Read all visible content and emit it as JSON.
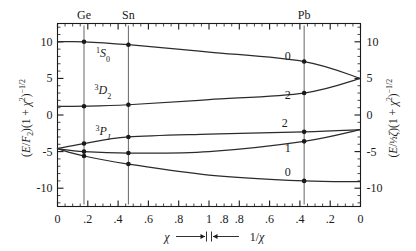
{
  "figure": {
    "left_axis_label": "(E/F₂)(1+χ²)⁻¹ᐟ²",
    "right_axis_label": "(E/½ζ)(1+χ²)⁻¹ᐟ²",
    "x_axis_caption_left": "χ",
    "x_axis_caption_right": "1/χ",
    "element_markers": [
      "Ge",
      "Sn",
      "Pb"
    ],
    "term_symbols": [
      "¹S₀",
      "³D₂",
      "³P_J"
    ],
    "curve_labels_right": [
      "0",
      "2",
      "2",
      "1",
      "0"
    ]
  },
  "chart_data": {
    "type": "line",
    "title": "",
    "xlabel": "χ  →|←  1/χ",
    "ylabel": "(E/F₂)(1+χ²)^-1/2",
    "ylabel_right": "(E/½ζ)(1+χ²)^-1/2",
    "ylim": [
      -12.5,
      12.5
    ],
    "yticks": [
      -10,
      -5,
      0,
      5,
      10
    ],
    "ytick_labels_left": [
      "-10",
      "-5",
      "0",
      "5",
      "10"
    ],
    "ytick_labels_right": [
      "-10",
      "-5",
      "0",
      "5",
      "10"
    ],
    "grid": false,
    "x_axis_split": {
      "left_half_var": "χ",
      "left_half_ticks": [
        0,
        0.2,
        0.4,
        0.6,
        0.8,
        1.0
      ],
      "left_half_tick_labels": [
        "0",
        ".2",
        ".4",
        ".6",
        ".8",
        "1"
      ],
      "right_half_var": "1/χ",
      "right_half_ticks": [
        1.0,
        0.8,
        0.6,
        0.4,
        0.2,
        0
      ],
      "right_half_tick_labels": [
        "1",
        ".8",
        ".6",
        ".4",
        ".2",
        "0"
      ]
    },
    "element_vlines": [
      {
        "label": "Ge",
        "u": 0.175
      },
      {
        "label": "Sn",
        "u": 0.468
      },
      {
        "label": "Pb",
        "u": 1.628
      }
    ],
    "series": [
      {
        "name": "1S0",
        "term": "¹S₀",
        "right_label": "0",
        "u": [
          0.0,
          0.175,
          0.468,
          1.0,
          1.628,
          2.0
        ],
        "values": [
          10.0,
          10.0,
          9.6,
          8.6,
          7.3,
          5.0
        ]
      },
      {
        "name": "3D2",
        "term": "³D₂",
        "right_label": "2",
        "u": [
          0.0,
          0.175,
          0.468,
          1.0,
          1.628,
          2.0
        ],
        "values": [
          1.2,
          1.2,
          1.4,
          2.1,
          3.0,
          5.0
        ]
      },
      {
        "name": "3P2",
        "term": "³P₂",
        "right_label": "2",
        "u": [
          0.0,
          0.175,
          0.468,
          1.0,
          1.628,
          2.0
        ],
        "values": [
          -4.6,
          -3.9,
          -3.0,
          -2.6,
          -2.3,
          -2.0
        ]
      },
      {
        "name": "3P1",
        "term": "³P₁",
        "right_label": "1",
        "u": [
          0.0,
          0.175,
          0.468,
          1.0,
          1.628,
          2.0
        ],
        "values": [
          -4.6,
          -5.0,
          -5.2,
          -5.0,
          -3.6,
          -2.0
        ]
      },
      {
        "name": "3P0",
        "term": "³P₀",
        "right_label": "0",
        "u": [
          0.0,
          0.175,
          0.468,
          1.0,
          1.628,
          2.0
        ],
        "values": [
          -4.6,
          -5.6,
          -6.7,
          -8.2,
          -9.0,
          -9.1
        ]
      }
    ],
    "data_points": [
      {
        "element": "Ge",
        "u": 0.175,
        "series": "1S0",
        "value": 10.0
      },
      {
        "element": "Ge",
        "u": 0.175,
        "series": "3D2",
        "value": 1.2
      },
      {
        "element": "Ge",
        "u": 0.175,
        "series": "3P2",
        "value": -3.9
      },
      {
        "element": "Ge",
        "u": 0.175,
        "series": "3P1",
        "value": -5.0
      },
      {
        "element": "Ge",
        "u": 0.175,
        "series": "3P0",
        "value": -5.6
      },
      {
        "element": "Sn",
        "u": 0.468,
        "series": "1S0",
        "value": 9.6
      },
      {
        "element": "Sn",
        "u": 0.468,
        "series": "3D2",
        "value": 1.4
      },
      {
        "element": "Sn",
        "u": 0.468,
        "series": "3P2",
        "value": -3.0
      },
      {
        "element": "Sn",
        "u": 0.468,
        "series": "3P1",
        "value": -5.2
      },
      {
        "element": "Sn",
        "u": 0.468,
        "series": "3P0",
        "value": -6.7
      },
      {
        "element": "Pb",
        "u": 1.628,
        "series": "1S0",
        "value": 7.3
      },
      {
        "element": "Pb",
        "u": 1.628,
        "series": "3D2",
        "value": 3.0
      },
      {
        "element": "Pb",
        "u": 1.628,
        "series": "3P2",
        "value": -2.3
      },
      {
        "element": "Pb",
        "u": 1.628,
        "series": "3P1",
        "value": -3.6
      },
      {
        "element": "Pb",
        "u": 1.628,
        "series": "3P0",
        "value": -9.0
      }
    ]
  },
  "colors": {
    "ink": "#1a1a1a",
    "curve": "#2b2b2b",
    "vline": "#555555",
    "background": "#ffffff"
  }
}
